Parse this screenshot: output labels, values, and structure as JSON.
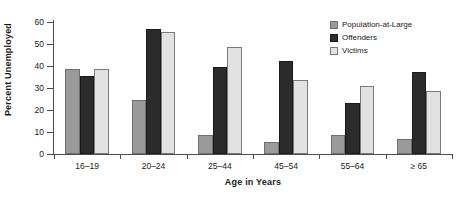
{
  "chart_data": {
    "type": "bar",
    "title": "",
    "subtitle": "",
    "xlabel": "Age in Years",
    "ylabel": "Percent Unemployed",
    "categories": [
      "16–19",
      "20–24",
      "25–44",
      "45–54",
      "55–64",
      "≥ 65"
    ],
    "series": [
      {
        "name": "Population-at-Large",
        "color": "#9a9a9a",
        "values": [
          38.5,
          24.5,
          8.5,
          5.5,
          8.5,
          7.0
        ]
      },
      {
        "name": "Offenders",
        "color": "#2b2b2b",
        "values": [
          35.5,
          57.0,
          39.5,
          42.5,
          23.0,
          37.5
        ]
      },
      {
        "name": "Victims",
        "color": "#e2e2e2",
        "values": [
          38.5,
          55.5,
          48.5,
          33.5,
          31.0,
          28.5
        ]
      }
    ],
    "ylim": [
      0,
      60
    ],
    "yticks": [
      0,
      10,
      20,
      30,
      40,
      50,
      60
    ],
    "ytick_labels": [
      "0",
      "10",
      "20",
      "30",
      "40",
      "50",
      "60"
    ],
    "grid": false,
    "legend_position": "top-right"
  }
}
